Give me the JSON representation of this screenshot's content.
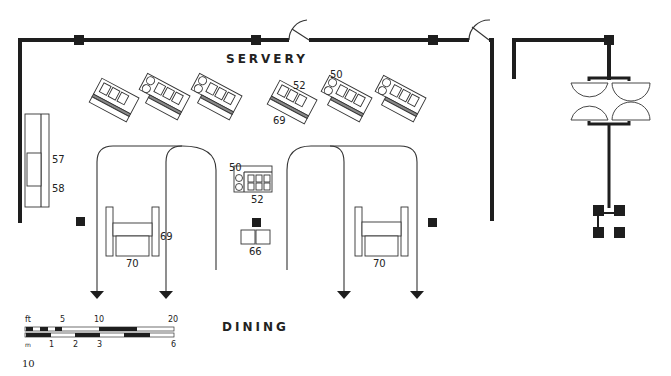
{
  "diagram": {
    "type": "architectural-floor-plan",
    "rooms": {
      "servery": "SERVERY",
      "dining": "DINING"
    },
    "labels": {
      "wall_unit_top": "57",
      "wall_unit_bottom": "58",
      "counter_a_top": "52",
      "counter_a_bottom": "69",
      "counter_b_top": "50",
      "island_top": "50",
      "island_bottom": "52",
      "left_lane_side": "69",
      "left_station": "70",
      "center_unit": "66",
      "right_station": "70"
    },
    "scale_bar": {
      "feet_unit": "ft",
      "feet_ticks": [
        "5",
        "10",
        "20"
      ],
      "metric_unit": "m",
      "metric_ticks": [
        "1",
        "2",
        "3",
        "6"
      ]
    },
    "page_number": "10",
    "colors": {
      "wall": "#1e1e1e",
      "line": "#333333",
      "background": "#ffffff"
    }
  }
}
